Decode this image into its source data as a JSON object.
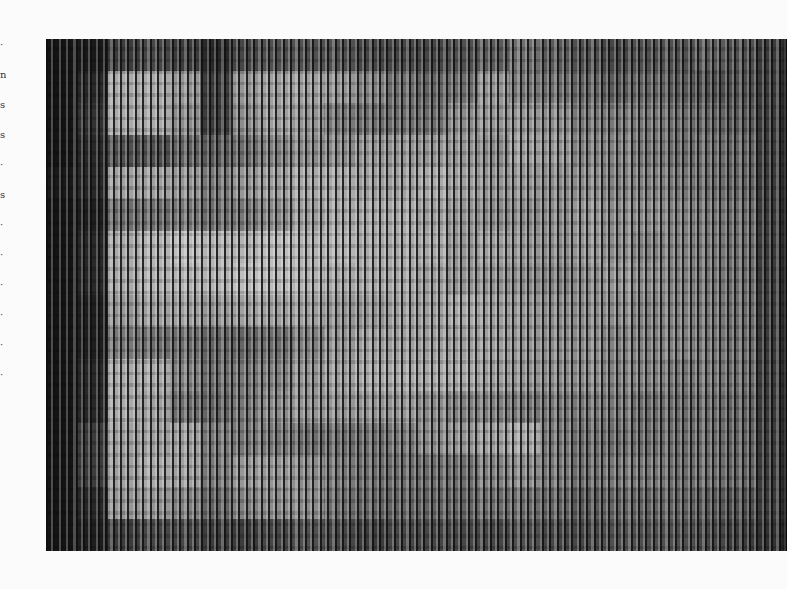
{
  "page": {
    "background": "#fbfbfb"
  },
  "margin_glyphs": [
    "·",
    "n",
    "s",
    "s",
    "·",
    "s",
    "·",
    "·",
    "·",
    "·",
    "·",
    "·"
  ],
  "artwork": {
    "description": "Scanned grayscale computer-generated pixel artwork rendered as vertical bars",
    "frame": {
      "x": 46,
      "y": 39,
      "width": 741,
      "height": 512
    },
    "grid_cols": 24,
    "grid_rows": 16,
    "gray_levels": [
      [
        20,
        25,
        60,
        70,
        60,
        40,
        70,
        80,
        80,
        80,
        70,
        70,
        70,
        80,
        90,
        110,
        90,
        80,
        70,
        80,
        80,
        90,
        80,
        60
      ],
      [
        20,
        40,
        170,
        170,
        150,
        60,
        150,
        160,
        160,
        150,
        130,
        110,
        100,
        110,
        150,
        120,
        110,
        100,
        90,
        100,
        90,
        80,
        80,
        60
      ],
      [
        20,
        50,
        170,
        170,
        140,
        60,
        140,
        160,
        150,
        120,
        110,
        110,
        110,
        140,
        150,
        150,
        140,
        120,
        120,
        120,
        110,
        100,
        90,
        60
      ],
      [
        20,
        40,
        80,
        80,
        100,
        90,
        110,
        130,
        140,
        140,
        150,
        150,
        150,
        150,
        140,
        160,
        150,
        130,
        130,
        120,
        110,
        110,
        100,
        60
      ],
      [
        25,
        40,
        160,
        160,
        150,
        120,
        150,
        160,
        170,
        170,
        160,
        160,
        170,
        160,
        150,
        150,
        140,
        140,
        130,
        130,
        120,
        110,
        100,
        60
      ],
      [
        20,
        30,
        110,
        110,
        120,
        110,
        120,
        140,
        160,
        170,
        170,
        170,
        160,
        150,
        140,
        140,
        140,
        150,
        140,
        140,
        130,
        120,
        110,
        60
      ],
      [
        20,
        40,
        170,
        180,
        190,
        180,
        180,
        190,
        180,
        180,
        170,
        170,
        170,
        150,
        160,
        150,
        140,
        150,
        140,
        130,
        130,
        120,
        110,
        60
      ],
      [
        20,
        40,
        170,
        180,
        180,
        180,
        190,
        190,
        180,
        170,
        170,
        170,
        160,
        150,
        150,
        140,
        130,
        140,
        150,
        140,
        130,
        120,
        110,
        60
      ],
      [
        20,
        30,
        150,
        160,
        160,
        150,
        160,
        160,
        160,
        150,
        150,
        160,
        160,
        170,
        160,
        150,
        140,
        140,
        140,
        130,
        130,
        120,
        110,
        60
      ],
      [
        20,
        30,
        120,
        110,
        110,
        100,
        100,
        110,
        130,
        150,
        160,
        160,
        160,
        160,
        160,
        150,
        140,
        140,
        130,
        130,
        130,
        120,
        110,
        60
      ],
      [
        20,
        40,
        170,
        170,
        130,
        110,
        120,
        130,
        150,
        160,
        170,
        170,
        170,
        170,
        160,
        150,
        140,
        140,
        130,
        130,
        120,
        120,
        110,
        60
      ],
      [
        20,
        40,
        170,
        160,
        110,
        100,
        120,
        140,
        150,
        150,
        150,
        150,
        140,
        130,
        130,
        120,
        120,
        120,
        120,
        110,
        110,
        110,
        100,
        60
      ],
      [
        20,
        60,
        160,
        160,
        160,
        120,
        120,
        120,
        110,
        110,
        110,
        120,
        140,
        150,
        160,
        170,
        120,
        110,
        110,
        110,
        110,
        110,
        100,
        60
      ],
      [
        20,
        60,
        160,
        170,
        160,
        120,
        150,
        150,
        140,
        120,
        110,
        110,
        110,
        110,
        130,
        140,
        120,
        110,
        120,
        120,
        110,
        110,
        100,
        60
      ],
      [
        20,
        40,
        150,
        150,
        130,
        100,
        130,
        140,
        140,
        110,
        100,
        100,
        100,
        100,
        110,
        110,
        100,
        90,
        100,
        100,
        100,
        90,
        80,
        60
      ],
      [
        20,
        30,
        60,
        70,
        70,
        60,
        60,
        70,
        80,
        70,
        60,
        70,
        70,
        70,
        70,
        80,
        70,
        70,
        80,
        80,
        80,
        70,
        60,
        50
      ]
    ]
  }
}
